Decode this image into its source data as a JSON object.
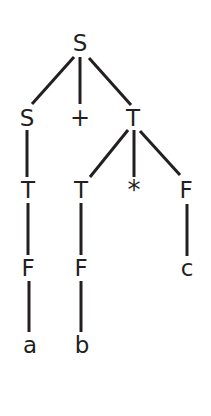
{
  "figure": {
    "background_color": "#ffffff",
    "stroke_color": "#231f20",
    "text_color": "#231f20",
    "stroke_width": 3,
    "width": 211,
    "height": 416
  },
  "chart_data": {
    "type": "diagram",
    "diagram_kind": "parse-tree",
    "root": "n-s-root",
    "nodes": [
      {
        "id": "n-s-root",
        "label": "S",
        "x": 80,
        "y": 43,
        "level": 0,
        "kind": "nonterminal"
      },
      {
        "id": "n-s-left",
        "label": "S",
        "x": 27,
        "y": 118,
        "level": 1,
        "kind": "nonterminal"
      },
      {
        "id": "n-plus",
        "label": "+",
        "x": 80,
        "y": 118,
        "level": 1,
        "kind": "terminal"
      },
      {
        "id": "n-t-right",
        "label": "T",
        "x": 133,
        "y": 118,
        "level": 1,
        "kind": "nonterminal"
      },
      {
        "id": "n-t-a",
        "label": "T",
        "x": 28,
        "y": 190,
        "level": 2,
        "kind": "nonterminal"
      },
      {
        "id": "n-t-b",
        "label": "T",
        "x": 81,
        "y": 190,
        "level": 2,
        "kind": "nonterminal"
      },
      {
        "id": "n-star",
        "label": "*",
        "x": 134,
        "y": 190,
        "level": 2,
        "kind": "terminal"
      },
      {
        "id": "n-f-c",
        "label": "F",
        "x": 186,
        "y": 190,
        "level": 2,
        "kind": "nonterminal"
      },
      {
        "id": "n-f-a",
        "label": "F",
        "x": 28,
        "y": 268,
        "level": 3,
        "kind": "nonterminal"
      },
      {
        "id": "n-f-b",
        "label": "F",
        "x": 81,
        "y": 268,
        "level": 3,
        "kind": "nonterminal"
      },
      {
        "id": "n-c",
        "label": "c",
        "x": 187,
        "y": 268,
        "level": 3,
        "kind": "terminal"
      },
      {
        "id": "n-a",
        "label": "a",
        "x": 30,
        "y": 345,
        "level": 4,
        "kind": "terminal"
      },
      {
        "id": "n-b",
        "label": "b",
        "x": 82,
        "y": 345,
        "level": 4,
        "kind": "terminal"
      }
    ],
    "edges": [
      {
        "from": "n-s-root",
        "to": "n-s-left",
        "x1": 74,
        "y1": 57,
        "x2": 32,
        "y2": 104
      },
      {
        "from": "n-s-root",
        "to": "n-plus",
        "x1": 80,
        "y1": 57,
        "x2": 80,
        "y2": 104
      },
      {
        "from": "n-s-root",
        "to": "n-t-right",
        "x1": 89,
        "y1": 58,
        "x2": 131,
        "y2": 105
      },
      {
        "from": "n-s-left",
        "to": "n-t-a",
        "x1": 27,
        "y1": 130,
        "x2": 27,
        "y2": 177
      },
      {
        "from": "n-t-right",
        "to": "n-t-b",
        "x1": 128,
        "y1": 130,
        "x2": 90,
        "y2": 177
      },
      {
        "from": "n-t-right",
        "to": "n-star",
        "x1": 134,
        "y1": 130,
        "x2": 134,
        "y2": 177
      },
      {
        "from": "n-t-right",
        "to": "n-f-c",
        "x1": 140,
        "y1": 131,
        "x2": 180,
        "y2": 175
      },
      {
        "from": "n-t-a",
        "to": "n-f-a",
        "x1": 28,
        "y1": 203,
        "x2": 28,
        "y2": 255
      },
      {
        "from": "n-t-b",
        "to": "n-f-b",
        "x1": 81,
        "y1": 203,
        "x2": 81,
        "y2": 255
      },
      {
        "from": "n-f-c",
        "to": "n-c",
        "x1": 187,
        "y1": 204,
        "x2": 187,
        "y2": 256
      },
      {
        "from": "n-f-a",
        "to": "n-a",
        "x1": 29,
        "y1": 281,
        "x2": 29,
        "y2": 332
      },
      {
        "from": "n-f-b",
        "to": "n-b",
        "x1": 81,
        "y1": 281,
        "x2": 81,
        "y2": 332
      }
    ]
  }
}
